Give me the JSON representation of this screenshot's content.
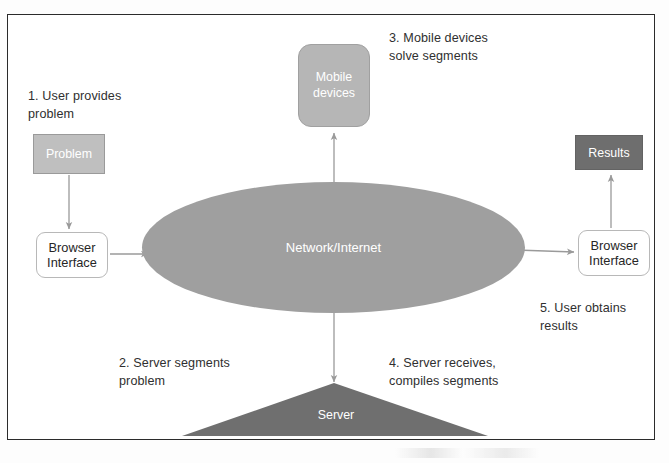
{
  "diagram": {
    "nodes": {
      "problem": {
        "label": "Problem",
        "shape": "rectangle",
        "fill": "#bfbfbf",
        "text_color": "#ffffff"
      },
      "browser_left": {
        "label": "Browser\nInterface",
        "shape": "rounded-rectangle",
        "fill": "#ffffff",
        "text_color": "#262626"
      },
      "browser_right": {
        "label": "Browser\nInterface",
        "shape": "rounded-rectangle",
        "fill": "#ffffff",
        "text_color": "#262626"
      },
      "mobile_devices": {
        "label": "Mobile\ndevices",
        "shape": "rounded-square",
        "fill": "#b6b6b6",
        "text_color": "#ffffff"
      },
      "network": {
        "label": "Network/Internet",
        "shape": "ellipse",
        "fill": "#9f9f9f",
        "text_color": "#ffffff"
      },
      "server": {
        "label": "Server",
        "shape": "triangle",
        "fill": "#6f6f6f",
        "text_color": "#ffffff"
      },
      "results": {
        "label": "Results",
        "shape": "rectangle",
        "fill": "#6e6e6e",
        "text_color": "#ffffff"
      }
    },
    "steps": [
      {
        "number": "1",
        "text": "1. User provides\nproblem"
      },
      {
        "number": "2",
        "text": "2. Server segments\nproblem"
      },
      {
        "number": "3",
        "text": "3. Mobile devices\nsolve segments"
      },
      {
        "number": "4",
        "text": "4. Server receives,\ncompiles segments"
      },
      {
        "number": "5",
        "text": "5. User obtains\nresults"
      }
    ],
    "connectors": [
      {
        "from": "problem",
        "to": "browser_left",
        "direction": "single",
        "orientation": "vertical"
      },
      {
        "from": "browser_left",
        "to": "network",
        "direction": "single",
        "orientation": "horizontal"
      },
      {
        "from": "mobile_devices",
        "to": "network",
        "direction": "double",
        "orientation": "vertical"
      },
      {
        "from": "network",
        "to": "server",
        "direction": "double",
        "orientation": "vertical"
      },
      {
        "from": "network",
        "to": "browser_right",
        "direction": "single",
        "orientation": "horizontal"
      },
      {
        "from": "browser_right",
        "to": "results",
        "direction": "single",
        "orientation": "vertical"
      }
    ],
    "colors": {
      "frame_border": "#2b2b2b",
      "arrow": "#9a9a9a",
      "light_gray": "#bfbfbf",
      "mid_gray": "#9f9f9f",
      "dark_gray": "#6e6e6e",
      "page": "#ffffff"
    }
  }
}
